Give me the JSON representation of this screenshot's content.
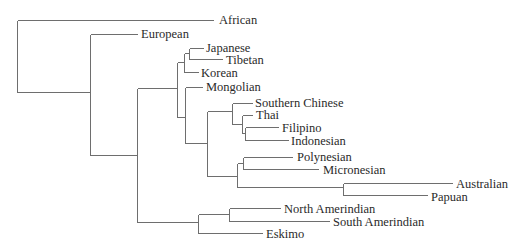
{
  "diagram": {
    "type": "phylogenetic-tree",
    "line_color": "#6e6e6e",
    "text_color": "#2a2a2a",
    "leaves": [
      {
        "id": "african",
        "label": "African",
        "x": 219,
        "y": 20
      },
      {
        "id": "european",
        "label": "European",
        "x": 141,
        "y": 34
      },
      {
        "id": "japanese",
        "label": "Japanese",
        "x": 206,
        "y": 48
      },
      {
        "id": "tibetan",
        "label": "Tibetan",
        "x": 226,
        "y": 60
      },
      {
        "id": "korean",
        "label": "Korean",
        "x": 201,
        "y": 73
      },
      {
        "id": "mongolian",
        "label": "Mongolian",
        "x": 206,
        "y": 87
      },
      {
        "id": "southern-chinese",
        "label": "Southern Chinese",
        "x": 255,
        "y": 103
      },
      {
        "id": "thai",
        "label": "Thai",
        "x": 256,
        "y": 115
      },
      {
        "id": "filipino",
        "label": "Filipino",
        "x": 282,
        "y": 128
      },
      {
        "id": "indonesian",
        "label": "Indonesian",
        "x": 291,
        "y": 141
      },
      {
        "id": "polynesian",
        "label": "Polynesian",
        "x": 297,
        "y": 157
      },
      {
        "id": "micronesian",
        "label": "Micronesian",
        "x": 323,
        "y": 170
      },
      {
        "id": "australian",
        "label": "Australian",
        "x": 456,
        "y": 184
      },
      {
        "id": "papuan",
        "label": "Papuan",
        "x": 431,
        "y": 197
      },
      {
        "id": "north-amerindian",
        "label": "North Amerindian",
        "x": 284,
        "y": 209
      },
      {
        "id": "south-amerindian",
        "label": "South Amerindian",
        "x": 333,
        "y": 222
      },
      {
        "id": "eskimo",
        "label": "Eskimo",
        "x": 266,
        "y": 234
      }
    ],
    "edges": [
      [
        17,
        20,
        17,
        92
      ],
      [
        17,
        20,
        213,
        20
      ],
      [
        17,
        92,
        90,
        92
      ],
      [
        90,
        34,
        90,
        155
      ],
      [
        90,
        34,
        137,
        34
      ],
      [
        90,
        155,
        137,
        155
      ],
      [
        137,
        88,
        137,
        222
      ],
      [
        137,
        88,
        177,
        88
      ],
      [
        137,
        222,
        198,
        222
      ],
      [
        177,
        62,
        177,
        117
      ],
      [
        177,
        62,
        184,
        62
      ],
      [
        177,
        117,
        185,
        117
      ],
      [
        184,
        53,
        184,
        72
      ],
      [
        184,
        53,
        189,
        53
      ],
      [
        184,
        72,
        198,
        72
      ],
      [
        189,
        48,
        189,
        59
      ],
      [
        189,
        48,
        203,
        48
      ],
      [
        189,
        59,
        222,
        59
      ],
      [
        185,
        87,
        185,
        143
      ],
      [
        185,
        87,
        202,
        87
      ],
      [
        185,
        143,
        207,
        143
      ],
      [
        207,
        111,
        207,
        176
      ],
      [
        207,
        111,
        232,
        111
      ],
      [
        207,
        176,
        237,
        176
      ],
      [
        232,
        103,
        232,
        124
      ],
      [
        232,
        103,
        252,
        103
      ],
      [
        232,
        124,
        242,
        124
      ],
      [
        242,
        115,
        242,
        133
      ],
      [
        242,
        115,
        252,
        115
      ],
      [
        242,
        133,
        245,
        133
      ],
      [
        245,
        127,
        245,
        140
      ],
      [
        245,
        127,
        278,
        127
      ],
      [
        245,
        140,
        288,
        140
      ],
      [
        237,
        163,
        237,
        187
      ],
      [
        237,
        163,
        243,
        163
      ],
      [
        237,
        187,
        343,
        187
      ],
      [
        243,
        157,
        243,
        169
      ],
      [
        243,
        157,
        292,
        157
      ],
      [
        243,
        169,
        318,
        169
      ],
      [
        343,
        183,
        343,
        195
      ],
      [
        343,
        183,
        452,
        183
      ],
      [
        343,
        195,
        427,
        195
      ],
      [
        198,
        214,
        198,
        233
      ],
      [
        198,
        214,
        229,
        214
      ],
      [
        198,
        233,
        262,
        233
      ],
      [
        229,
        208,
        229,
        221
      ],
      [
        229,
        208,
        280,
        208
      ],
      [
        229,
        221,
        329,
        221
      ]
    ]
  }
}
